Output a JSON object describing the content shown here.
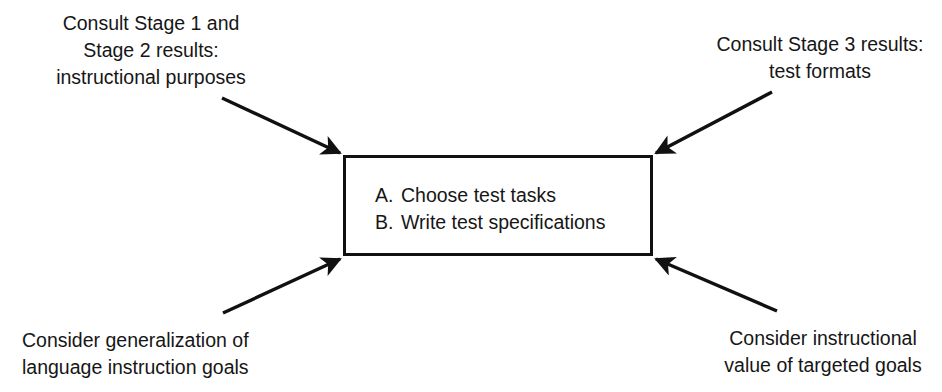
{
  "diagram": {
    "stroke_color": "#111111",
    "text_color": "#161616",
    "background_color": "#ffffff",
    "process_box": {
      "items": [
        {
          "marker": "A.",
          "text": "Choose test tasks"
        },
        {
          "marker": "B.",
          "text": "Write test specifications"
        }
      ]
    },
    "annotations": {
      "top_left": {
        "lines": [
          "Consult Stage 1 and",
          "Stage 2 results:",
          "instructional purposes"
        ]
      },
      "top_right": {
        "lines": [
          "Consult Stage 3 results:",
          "test formats"
        ]
      },
      "bottom_left": {
        "lines": [
          "Consider generalization of",
          "language instruction goals"
        ]
      },
      "bottom_right": {
        "lines": [
          "Consider instructional",
          "value of targeted goals"
        ]
      }
    },
    "arrows": [
      {
        "name": "arrow-top-left-to-box",
        "from": [
          222,
          98
        ],
        "to": [
          343,
          155
        ]
      },
      {
        "name": "arrow-top-right-to-box",
        "from": [
          772,
          92
        ],
        "to": [
          653,
          155
        ]
      },
      {
        "name": "arrow-bottom-left-to-box",
        "from": [
          223,
          313
        ],
        "to": [
          343,
          257
        ]
      },
      {
        "name": "arrow-bottom-right-to-box",
        "from": [
          777,
          311
        ],
        "to": [
          653,
          257
        ]
      }
    ]
  }
}
